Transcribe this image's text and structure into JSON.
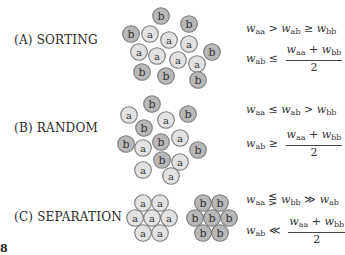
{
  "figure_number": "8",
  "colors": {
    "a_fill": "#e2e2e2",
    "b_fill": "#b8b8b8",
    "stroke": "#7a7a7a",
    "text": "#333333"
  },
  "rows": [
    {
      "label": "(A)  SORTING",
      "eq1": {
        "lhs": "w",
        "lhs_sub": "aa",
        "op1": ">",
        "mid": "w",
        "mid_sub": "ab",
        "op2": "≥",
        "rhs": "w",
        "rhs_sub": "bb"
      },
      "eq2": {
        "lhs": "w",
        "lhs_sub": "ab",
        "op": "≤",
        "num_a": "w",
        "num_a_sub": "aa",
        "plus": "+",
        "num_b": "w",
        "num_b_sub": "bb",
        "den": "2"
      },
      "cells": [
        {
          "t": "b",
          "x": 161,
          "y": 16
        },
        {
          "t": "b",
          "x": 189,
          "y": 24
        },
        {
          "t": "b",
          "x": 131,
          "y": 34
        },
        {
          "t": "a",
          "x": 150,
          "y": 34
        },
        {
          "t": "a",
          "x": 169,
          "y": 40
        },
        {
          "t": "a",
          "x": 189,
          "y": 44
        },
        {
          "t": "b",
          "x": 212,
          "y": 52
        },
        {
          "t": "a",
          "x": 139,
          "y": 52
        },
        {
          "t": "a",
          "x": 157,
          "y": 56
        },
        {
          "t": "a",
          "x": 178,
          "y": 60
        },
        {
          "t": "a",
          "x": 197,
          "y": 64
        },
        {
          "t": "b",
          "x": 142,
          "y": 72
        },
        {
          "t": "b",
          "x": 166,
          "y": 76
        },
        {
          "t": "b",
          "x": 198,
          "y": 80
        }
      ]
    },
    {
      "label": "(B)  RANDOM",
      "eq1": {
        "lhs": "w",
        "lhs_sub": "aa",
        "op1": "≤",
        "mid": "w",
        "mid_sub": "ab",
        "op2": ">",
        "rhs": "w",
        "rhs_sub": "bb"
      },
      "eq2": {
        "lhs": "w",
        "lhs_sub": "ab",
        "op": "≥",
        "num_a": "w",
        "num_a_sub": "aa",
        "plus": "+",
        "num_b": "w",
        "num_b_sub": "bb",
        "den": "2"
      },
      "cells": [
        {
          "t": "b",
          "x": 152,
          "y": 104
        },
        {
          "t": "a",
          "x": 129,
          "y": 115
        },
        {
          "t": "a",
          "x": 166,
          "y": 120
        },
        {
          "t": "b",
          "x": 188,
          "y": 114
        },
        {
          "t": "b",
          "x": 144,
          "y": 128
        },
        {
          "t": "b",
          "x": 126,
          "y": 144
        },
        {
          "t": "a",
          "x": 143,
          "y": 148
        },
        {
          "t": "b",
          "x": 161,
          "y": 142
        },
        {
          "t": "a",
          "x": 180,
          "y": 138
        },
        {
          "t": "b",
          "x": 198,
          "y": 150
        },
        {
          "t": "b",
          "x": 162,
          "y": 160
        },
        {
          "t": "a",
          "x": 180,
          "y": 162
        },
        {
          "t": "a",
          "x": 143,
          "y": 170
        },
        {
          "t": "a",
          "x": 171,
          "y": 176
        }
      ]
    },
    {
      "label": "(C)  SEPARATION",
      "eq1": {
        "lhs": "w",
        "lhs_sub": "aa",
        "op1": "⋚",
        "mid": "w",
        "mid_sub": "bb",
        "op2": "≫",
        "rhs": "w",
        "rhs_sub": "ab"
      },
      "eq2": {
        "lhs": "w",
        "lhs_sub": "ab",
        "op": "≪",
        "num_a": "w",
        "num_a_sub": "aa",
        "plus": "+",
        "num_b": "w",
        "num_b_sub": "bb",
        "den": "2"
      },
      "cells": [
        {
          "t": "a",
          "x": 143,
          "y": 203
        },
        {
          "t": "a",
          "x": 160,
          "y": 203
        },
        {
          "t": "a",
          "x": 135,
          "y": 218
        },
        {
          "t": "a",
          "x": 152,
          "y": 218
        },
        {
          "t": "a",
          "x": 169,
          "y": 218
        },
        {
          "t": "a",
          "x": 143,
          "y": 233
        },
        {
          "t": "a",
          "x": 160,
          "y": 233
        },
        {
          "t": "b",
          "x": 203,
          "y": 203
        },
        {
          "t": "b",
          "x": 220,
          "y": 203
        },
        {
          "t": "b",
          "x": 195,
          "y": 218
        },
        {
          "t": "b",
          "x": 212,
          "y": 218
        },
        {
          "t": "b",
          "x": 229,
          "y": 218
        },
        {
          "t": "b",
          "x": 203,
          "y": 233
        },
        {
          "t": "b",
          "x": 220,
          "y": 233
        }
      ]
    }
  ]
}
